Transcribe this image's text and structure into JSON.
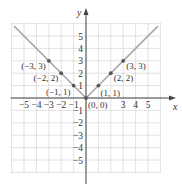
{
  "figure": {
    "function": "y = |x|",
    "axis_labels": {
      "x": "x",
      "y": "y"
    },
    "x_range": [
      -6,
      6
    ],
    "y_range": [
      -6,
      6
    ],
    "x_tick_labels": [
      {
        "value": -5,
        "label": "−5"
      },
      {
        "value": -4,
        "label": "−4"
      },
      {
        "value": -3,
        "label": "−3"
      },
      {
        "value": -2,
        "label": "−2"
      },
      {
        "value": -1,
        "label": "−1"
      },
      {
        "value": 3,
        "label": "3"
      },
      {
        "value": 4,
        "label": "4"
      },
      {
        "value": 5,
        "label": "5"
      }
    ],
    "y_tick_labels": [
      {
        "value": 5,
        "label": "5"
      },
      {
        "value": 4,
        "label": "4"
      },
      {
        "value": 3,
        "label": "3"
      },
      {
        "value": 2,
        "label": "2"
      },
      {
        "value": 1,
        "label": "1"
      },
      {
        "value": -1,
        "label": "−1"
      },
      {
        "value": -2,
        "label": "−2"
      },
      {
        "value": -3,
        "label": "−3"
      },
      {
        "value": -4,
        "label": "−4"
      },
      {
        "value": -5,
        "label": "−5"
      }
    ],
    "points": [
      {
        "x": -3,
        "y": 3,
        "label": "(−3, 3)",
        "side": "left"
      },
      {
        "x": -2,
        "y": 2,
        "label": "(−2, 2)",
        "side": "left"
      },
      {
        "x": -1,
        "y": 1,
        "label": "(−1, 1)",
        "side": "left-below"
      },
      {
        "x": 0,
        "y": 0,
        "label": "(0, 0)",
        "side": "right-below"
      },
      {
        "x": 1,
        "y": 1,
        "label": "(1, 1)",
        "side": "right-below"
      },
      {
        "x": 2,
        "y": 2,
        "label": "(2, 2)",
        "side": "right"
      },
      {
        "x": 3,
        "y": 3,
        "label": "(3, 3)",
        "side": "right"
      }
    ],
    "line_segments": [
      {
        "from": [
          -5.8,
          5.8
        ],
        "to": [
          0,
          0
        ]
      },
      {
        "from": [
          0,
          0
        ],
        "to": [
          5.8,
          5.8
        ]
      }
    ],
    "colors": {
      "grid": "#b8b8b8",
      "axis": "#444444",
      "graph_line": "#a8a8a8",
      "point": "#555555"
    }
  }
}
